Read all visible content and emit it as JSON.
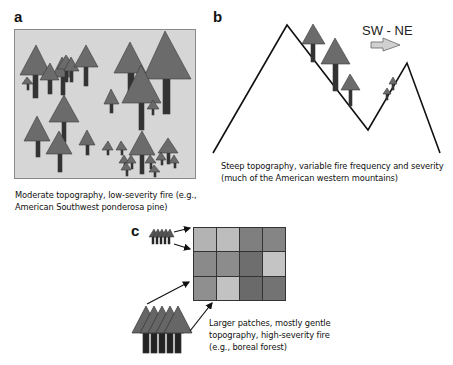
{
  "figure": {
    "panels": {
      "a": {
        "label": "a",
        "caption_line1": "Moderate topography, low-severity fire (e.g.,",
        "caption_line2": "American Southwest ponderosa pine)"
      },
      "b": {
        "label": "b",
        "direction_label": "SW - NE",
        "caption_line1": "Steep topography, variable fire frequency and severity",
        "caption_line2": "(much of the American western mountains)"
      },
      "c": {
        "label": "c",
        "caption_line1": "Larger patches, mostly gentle",
        "caption_line2": "topography, high-severity fire",
        "caption_line3": "(e.g., boreal forest)",
        "grid_rows": 3,
        "grid_cols": 4,
        "grid_cell_colors": [
          [
            "#b3b3b3",
            "#bdbdbd",
            "#7f7f7f",
            "#858585"
          ],
          [
            "#8a8a8a",
            "#8c8c8c",
            "#6e6e6e",
            "#c4c4c4"
          ],
          [
            "#8f8f8f",
            "#c2c2c2",
            "#6a6a6a",
            "#737373"
          ]
        ]
      }
    },
    "colors": {
      "panel_a_background": "#d6d6d6",
      "tree_crown": "#6b6b6b",
      "tree_trunk": "#333333",
      "mountain_line": "#111111",
      "direction_arrow_fill": "#d0d0d0"
    }
  }
}
